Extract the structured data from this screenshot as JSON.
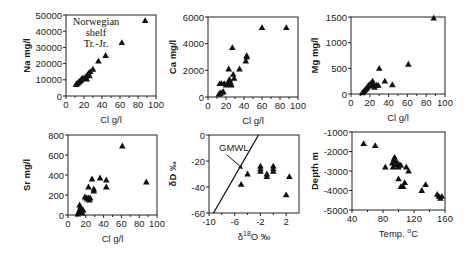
{
  "figure": {
    "annotation_lines": [
      "Norwegian",
      "shelf",
      "Tr.-Jr."
    ]
  },
  "chart_data": [
    {
      "id": "na",
      "type": "scatter",
      "title": "",
      "xlabel": "Cl g/l",
      "ylabel": "Na mg/l",
      "xlim": [
        0,
        100
      ],
      "ylim": [
        0,
        50000
      ],
      "xticks": [
        0,
        20,
        40,
        60,
        80,
        100
      ],
      "xtick_labels": [
        "0",
        "20",
        "40",
        "60",
        "80",
        "100"
      ],
      "yticks": [
        0,
        10000,
        20000,
        30000,
        40000,
        50000
      ],
      "ytick_labels": [
        "0",
        "10000",
        "20000",
        "30000",
        "40000",
        "50000"
      ],
      "annotation": [
        "Norwegian",
        "shelf",
        "Tr.-Jr."
      ],
      "points": [
        [
          11,
          7000
        ],
        [
          12,
          7500
        ],
        [
          13,
          8000
        ],
        [
          14,
          8500
        ],
        [
          15,
          9000
        ],
        [
          16,
          9500
        ],
        [
          17,
          10000
        ],
        [
          18,
          11000
        ],
        [
          20,
          11000
        ],
        [
          22,
          12000
        ],
        [
          24,
          13000
        ],
        [
          25,
          14000
        ],
        [
          27,
          15000
        ],
        [
          30,
          16500
        ],
        [
          26,
          12500
        ],
        [
          23,
          10500
        ],
        [
          36,
          21500
        ],
        [
          44,
          25000
        ],
        [
          62,
          33000
        ],
        [
          88,
          46500
        ]
      ]
    },
    {
      "id": "ca",
      "type": "scatter",
      "xlabel": "Cl g/l",
      "ylabel": "Ca mg/l",
      "xlim": [
        0,
        100
      ],
      "ylim": [
        0,
        6000
      ],
      "xticks": [
        0,
        20,
        40,
        60,
        80,
        100
      ],
      "xtick_labels": [
        "0",
        "20",
        "40",
        "60",
        "80",
        "100"
      ],
      "yticks": [
        0,
        2000,
        4000,
        6000
      ],
      "ytick_labels": [
        "0",
        "2000",
        "4000",
        "6000"
      ],
      "points": [
        [
          12,
          200
        ],
        [
          13,
          250
        ],
        [
          14,
          300
        ],
        [
          16,
          350
        ],
        [
          17,
          400
        ],
        [
          13,
          1000
        ],
        [
          15,
          1000
        ],
        [
          18,
          1000
        ],
        [
          20,
          900
        ],
        [
          22,
          1000
        ],
        [
          23,
          1200
        ],
        [
          24,
          1300
        ],
        [
          25,
          1100
        ],
        [
          26,
          900
        ],
        [
          28,
          1700
        ],
        [
          29,
          1400
        ],
        [
          23,
          2100
        ],
        [
          35,
          2100
        ],
        [
          27,
          3700
        ],
        [
          42,
          2700
        ],
        [
          43,
          3000
        ],
        [
          43,
          3100
        ],
        [
          60,
          5200
        ],
        [
          87,
          5200
        ]
      ]
    },
    {
      "id": "mg",
      "type": "scatter",
      "xlabel": "Cl g/l",
      "ylabel": "Mg mg/l",
      "xlim": [
        0,
        100
      ],
      "ylim": [
        0,
        1500
      ],
      "xticks": [
        0,
        20,
        40,
        60,
        80,
        100
      ],
      "xtick_labels": [
        "0",
        "20",
        "40",
        "60",
        "80",
        "100"
      ],
      "yticks": [
        0,
        500,
        1000,
        1500
      ],
      "ytick_labels": [
        "0",
        "500",
        "1000",
        "1500"
      ],
      "points": [
        [
          12,
          20
        ],
        [
          13,
          40
        ],
        [
          14,
          60
        ],
        [
          15,
          80
        ],
        [
          16,
          100
        ],
        [
          17,
          120
        ],
        [
          18,
          150
        ],
        [
          19,
          170
        ],
        [
          20,
          180
        ],
        [
          21,
          200
        ],
        [
          22,
          160
        ],
        [
          23,
          250
        ],
        [
          24,
          180
        ],
        [
          25,
          130
        ],
        [
          27,
          170
        ],
        [
          29,
          170
        ],
        [
          30,
          500
        ],
        [
          36,
          250
        ],
        [
          44,
          180
        ],
        [
          61,
          580
        ],
        [
          88,
          1480
        ]
      ]
    },
    {
      "id": "sr",
      "type": "scatter",
      "xlabel": "Cl g/l",
      "ylabel": "Sr mg/l",
      "xlim": [
        0,
        100
      ],
      "ylim": [
        0,
        800
      ],
      "xticks": [
        0,
        20,
        40,
        60,
        80,
        100
      ],
      "xtick_labels": [
        "0",
        "20",
        "40",
        "60",
        "80",
        "100"
      ],
      "yticks": [
        0,
        200,
        400,
        600,
        800
      ],
      "ytick_labels": [
        "0",
        "200",
        "400",
        "600",
        "800"
      ],
      "points": [
        [
          11,
          10
        ],
        [
          12,
          30
        ],
        [
          13,
          50
        ],
        [
          14,
          80
        ],
        [
          15,
          40
        ],
        [
          16,
          20
        ],
        [
          17,
          50
        ],
        [
          13,
          100
        ],
        [
          19,
          180
        ],
        [
          21,
          170
        ],
        [
          22,
          160
        ],
        [
          23,
          170
        ],
        [
          24,
          150
        ],
        [
          23,
          280
        ],
        [
          25,
          170
        ],
        [
          27,
          360
        ],
        [
          29,
          260
        ],
        [
          29,
          240
        ],
        [
          36,
          370
        ],
        [
          43,
          350
        ],
        [
          43,
          280
        ],
        [
          61,
          690
        ],
        [
          88,
          330
        ]
      ]
    },
    {
      "id": "isotope",
      "type": "scatter",
      "xlabel": "δ18O ‰",
      "xlabel_main": "δ",
      "xlabel_sup": "18",
      "xlabel_rest": "O ‰",
      "ylabel": "δD ‰",
      "xlim": [
        -10,
        4
      ],
      "ylim": [
        -60,
        0
      ],
      "xticks": [
        -10,
        -6,
        -2,
        2
      ],
      "xtick_labels": [
        "-10",
        "-6",
        "-2",
        "2"
      ],
      "yticks": [
        -60,
        -40,
        -20,
        0
      ],
      "ytick_labels": [
        "-60",
        "-40",
        "-20",
        "0"
      ],
      "reference_line": {
        "label": "GMWL",
        "from": [
          -9.3,
          -60
        ],
        "to": [
          -2.3,
          0
        ]
      },
      "points": [
        [
          -5.0,
          -38
        ],
        [
          -4.0,
          -30
        ],
        [
          -2.0,
          -24
        ],
        [
          -2.0,
          -26
        ],
        [
          -2.0,
          -28
        ],
        [
          -1.0,
          -30
        ],
        [
          -1.0,
          -32
        ],
        [
          0.0,
          -24
        ],
        [
          0.0,
          -26
        ],
        [
          0.0,
          -28
        ],
        [
          2.0,
          -46
        ],
        [
          2.5,
          -32
        ]
      ]
    },
    {
      "id": "depth",
      "type": "scatter",
      "xlabel": "Temp. °C",
      "xlabel_main": "Temp. ",
      "xlabel_sup": "o",
      "xlabel_rest": "C",
      "ylabel": "Depth m",
      "xlim": [
        40,
        160
      ],
      "ylim": [
        -5000,
        -1000
      ],
      "xticks": [
        40,
        80,
        120,
        160
      ],
      "xtick_labels": [
        "40",
        "80",
        "120",
        "160"
      ],
      "yticks": [
        -5000,
        -4000,
        -3000,
        -2000,
        -1000
      ],
      "ytick_labels": [
        "-5000",
        "-4000",
        "-3000",
        "-2000",
        "-1000"
      ],
      "points": [
        [
          55,
          -1600
        ],
        [
          70,
          -1700
        ],
        [
          83,
          -2800
        ],
        [
          92,
          -2600
        ],
        [
          94,
          -2400
        ],
        [
          95,
          -2300
        ],
        [
          96,
          -2500
        ],
        [
          93,
          -2800
        ],
        [
          97,
          -2700
        ],
        [
          99,
          -2600
        ],
        [
          101,
          -2700
        ],
        [
          103,
          -2700
        ],
        [
          100,
          -2800
        ],
        [
          110,
          -2800
        ],
        [
          113,
          -3000
        ],
        [
          100,
          -3400
        ],
        [
          103,
          -3800
        ],
        [
          106,
          -3800
        ],
        [
          108,
          -3600
        ],
        [
          130,
          -4000
        ],
        [
          135,
          -3700
        ],
        [
          150,
          -4200
        ],
        [
          152,
          -4300
        ],
        [
          154,
          -4400
        ],
        [
          156,
          -4300
        ]
      ]
    }
  ]
}
